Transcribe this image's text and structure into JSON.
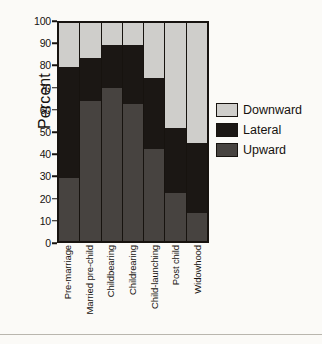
{
  "chart_data": {
    "type": "bar",
    "subtype": "stacked-bar-100",
    "title": "",
    "xlabel": "",
    "ylabel": "Percent",
    "ylim": [
      0,
      100
    ],
    "yticks": [
      0,
      10,
      20,
      30,
      40,
      50,
      60,
      70,
      80,
      90,
      100
    ],
    "grid": false,
    "legend_position": "right",
    "categories": [
      "Pre-marriage",
      "Married pre-child",
      "Childbearing",
      "Childrearing",
      "Child-launching",
      "Post child",
      "Widowhood"
    ],
    "series": [
      {
        "name": "Upward",
        "color": "#474340",
        "values": [
          29,
          64,
          70,
          63,
          42,
          22,
          13
        ]
      },
      {
        "name": "Lateral",
        "color": "#1b1714",
        "values": [
          51,
          20,
          20,
          27,
          33,
          30,
          32
        ]
      },
      {
        "name": "Downward",
        "color": "#cfcecb",
        "values": [
          20,
          16,
          10,
          10,
          25,
          48,
          55
        ]
      }
    ],
    "cumulative_tops": {
      "upward": [
        29,
        64,
        70,
        63,
        42,
        22,
        13
      ],
      "lateral": [
        80,
        84,
        90,
        90,
        75,
        52,
        45
      ],
      "downward": [
        100,
        100,
        100,
        100,
        100,
        100,
        100
      ]
    }
  },
  "legend": {
    "items": [
      {
        "label": "Downward",
        "color": "#cfcecb"
      },
      {
        "label": "Lateral",
        "color": "#1b1714"
      },
      {
        "label": "Upward",
        "color": "#474340"
      }
    ]
  },
  "axes": {
    "y_title": "Percent",
    "y_tick_labels": [
      "100",
      "90",
      "80",
      "70",
      "60",
      "50",
      "40",
      "30",
      "20",
      "10",
      "0"
    ],
    "x_tick_labels": [
      "Pre-marriage",
      "Married pre-child",
      "Childbearing",
      "Childrearing",
      "Child-launching",
      "Post child",
      "Widowhood"
    ]
  },
  "colors": {
    "background": "#fbfaf7",
    "ink": "#17130f",
    "downward": "#cfcecb",
    "lateral": "#1b1714",
    "upward": "#474340",
    "rule": "#b9b6ae"
  }
}
